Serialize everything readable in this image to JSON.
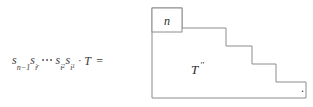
{
  "figure": {
    "background_color": "#ffffff",
    "line_color": "#8c8c8c",
    "text_color": "#2b2b2b",
    "trailing_punctuation": "."
  },
  "equation": {
    "full_text": "s_{n-1} s_{i_r} ⋯ s_{i_2} s_{i_1} · T =",
    "terms": [
      {
        "base": "s",
        "sub": "n",
        "sub_suffix": "−1",
        "subsub": ""
      },
      {
        "base": "s",
        "sub": "i",
        "sub_suffix": "",
        "subsub": "r"
      },
      {
        "base": "s",
        "sub": "i",
        "sub_suffix": "",
        "subsub": "2"
      },
      {
        "base": "s",
        "sub": "i",
        "sub_suffix": "",
        "subsub": "1"
      }
    ],
    "ellipsis": "⋯",
    "dot_operator": "·",
    "operand": "T",
    "equals": "="
  },
  "diagram": {
    "type": "staircase-young-diagram",
    "corner_cell_label": "n",
    "region_label": "T",
    "region_label_primes": "′′",
    "region_label_full": "T′′",
    "outline_points": "4,6 78,6 78,28 152,28 152,50 174,50 174,72 200,72 200,94 4,94",
    "corner_cell": {
      "x": 4,
      "y": 6,
      "width": 30,
      "height": 24
    },
    "steps": [
      {
        "x": 78,
        "y": 28
      },
      {
        "x": 152,
        "y": 50
      },
      {
        "x": 174,
        "y": 72
      },
      {
        "x": 200,
        "y": 94
      }
    ]
  }
}
